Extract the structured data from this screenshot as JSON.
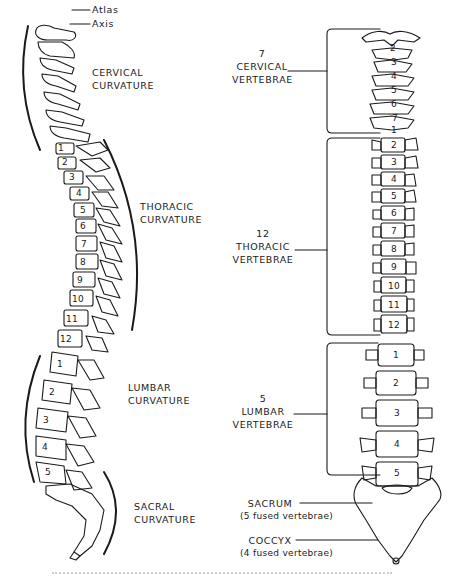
{
  "figure": {
    "left_panel": {
      "description": "lateral view of vertebral column",
      "pointer_labels": [
        {
          "id": "atlas",
          "text": "Atlas"
        },
        {
          "id": "axis",
          "text": "Axis"
        }
      ],
      "curvatures": [
        {
          "id": "cervical",
          "line1": "CERVICAL",
          "line2": "CURVATURE"
        },
        {
          "id": "thoracic",
          "line1": "THORACIC",
          "line2": "CURVATURE"
        },
        {
          "id": "lumbar",
          "line1": "LUMBAR",
          "line2": "CURVATURE"
        },
        {
          "id": "sacral",
          "line1": "SACRAL",
          "line2": "CURVATURE"
        }
      ],
      "thoracic_numbers": [
        "1",
        "2",
        "3",
        "4",
        "5",
        "6",
        "7",
        "8",
        "9",
        "10",
        "11",
        "12"
      ],
      "lumbar_numbers": [
        "1",
        "2",
        "3",
        "4",
        "5"
      ]
    },
    "right_panel": {
      "description": "posterior/anterior view of vertebral column",
      "groups": [
        {
          "id": "cervical",
          "count": "7",
          "line1": "CERVICAL",
          "line2": "VERTEBRAE",
          "numbers": [
            "1",
            "2",
            "3",
            "4",
            "5",
            "6",
            "7"
          ]
        },
        {
          "id": "thoracic",
          "count": "12",
          "line1": "THORACIC",
          "line2": "VERTEBRAE",
          "numbers": [
            "1",
            "2",
            "3",
            "4",
            "5",
            "6",
            "7",
            "8",
            "9",
            "10",
            "11",
            "12"
          ]
        },
        {
          "id": "lumbar",
          "count": "5",
          "line1": "LUMBAR",
          "line2": "VERTEBRAE",
          "numbers": [
            "1",
            "2",
            "3",
            "4",
            "5"
          ]
        }
      ],
      "fused": [
        {
          "id": "sacrum",
          "name": "SACRUM",
          "note": "(5 fused vertebrae)"
        },
        {
          "id": "coccyx",
          "name": "COCCYX",
          "note": "(4 fused vertebrae)"
        }
      ]
    },
    "colors": {
      "ink": "#1a1a1a",
      "paper": "#ffffff"
    }
  }
}
